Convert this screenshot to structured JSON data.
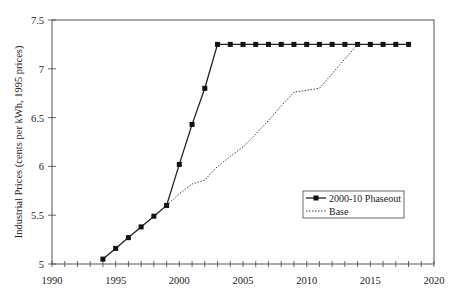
{
  "chart_data": {
    "type": "line",
    "title": "",
    "xlabel": "",
    "ylabel": "Industrial Prices (cents per kWh, 1995 prices)",
    "xlim": [
      1990,
      2020
    ],
    "ylim": [
      5,
      7.5
    ],
    "x_ticks": [
      "1990",
      "1995",
      "2000",
      "2005",
      "2010",
      "2015",
      "2020"
    ],
    "y_ticks": [
      "5",
      "5.5",
      "6",
      "6.5",
      "7",
      "7.5"
    ],
    "grid": false,
    "legend_position": "lower right (inside)",
    "series": [
      {
        "name": "2000-10 Phaseout",
        "style": "solid line with square markers",
        "x": [
          1994,
          1995,
          1996,
          1997,
          1998,
          1999,
          2000,
          2001,
          2002,
          2003,
          2004,
          2005,
          2006,
          2007,
          2008,
          2009,
          2010,
          2011,
          2012,
          2013,
          2014,
          2015,
          2016,
          2017,
          2018
        ],
        "values": [
          5.05,
          5.16,
          5.27,
          5.38,
          5.49,
          5.6,
          6.02,
          6.43,
          6.8,
          7.25,
          7.25,
          7.25,
          7.25,
          7.25,
          7.25,
          7.25,
          7.25,
          7.25,
          7.25,
          7.25,
          7.25,
          7.25,
          7.25,
          7.25,
          7.25
        ]
      },
      {
        "name": "Base",
        "style": "dotted line",
        "x": [
          1999,
          2000,
          2001,
          2002,
          2003,
          2004,
          2005,
          2006,
          2007,
          2008,
          2009,
          2010,
          2011,
          2012,
          2013,
          2014
        ],
        "values": [
          5.6,
          5.72,
          5.82,
          5.86,
          6.0,
          6.1,
          6.2,
          6.33,
          6.47,
          6.62,
          6.76,
          6.78,
          6.8,
          6.95,
          7.1,
          7.25
        ]
      }
    ]
  },
  "legend": {
    "items": [
      "2000-10 Phaseout",
      "Base"
    ]
  }
}
